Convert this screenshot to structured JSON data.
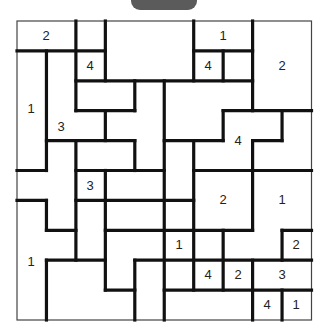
{
  "top_button": {
    "label": "",
    "color": "#5b5b5b"
  },
  "board": {
    "rows": 10,
    "cols": 10,
    "origin": [
      17,
      21
    ],
    "cell_w": 29.45,
    "cell_h": 29.9,
    "thin_border_color": "#444444",
    "wall_color": "#111111",
    "vertical_walls": [
      [
        1,
        1,
        5
      ],
      [
        1,
        6,
        7
      ],
      [
        1,
        8,
        10
      ],
      [
        2,
        0,
        3
      ],
      [
        2,
        4,
        8
      ],
      [
        3,
        0,
        2
      ],
      [
        3,
        3,
        4
      ],
      [
        3,
        5,
        9
      ],
      [
        4,
        2,
        3
      ],
      [
        4,
        4,
        5
      ],
      [
        4,
        8,
        10
      ],
      [
        5,
        2,
        10
      ],
      [
        6,
        0,
        2
      ],
      [
        6,
        4,
        9
      ],
      [
        7,
        1,
        2
      ],
      [
        7,
        3,
        4
      ],
      [
        7,
        7,
        9
      ],
      [
        8,
        0,
        3
      ],
      [
        8,
        4,
        7
      ],
      [
        8,
        8,
        10
      ],
      [
        9,
        3,
        4
      ],
      [
        9,
        7,
        8
      ],
      [
        9,
        9,
        10
      ]
    ],
    "horizontal_walls": [
      [
        1,
        0,
        3
      ],
      [
        1,
        6,
        8
      ],
      [
        2,
        2,
        8
      ],
      [
        3,
        2,
        4
      ],
      [
        3,
        7,
        10
      ],
      [
        4,
        1,
        4
      ],
      [
        4,
        5,
        7
      ],
      [
        4,
        8,
        9
      ],
      [
        5,
        0,
        1
      ],
      [
        5,
        2,
        5
      ],
      [
        5,
        6,
        10
      ],
      [
        6,
        0,
        1
      ],
      [
        6,
        2,
        6
      ],
      [
        7,
        1,
        2
      ],
      [
        7,
        3,
        8
      ],
      [
        7,
        9,
        10
      ],
      [
        8,
        1,
        3
      ],
      [
        8,
        4,
        10
      ],
      [
        9,
        3,
        4
      ],
      [
        9,
        5,
        10
      ]
    ],
    "clues": [
      {
        "value": "2",
        "x": 46,
        "y": 36
      },
      {
        "value": "1",
        "x": 223,
        "y": 36
      },
      {
        "value": "4",
        "x": 90,
        "y": 66
      },
      {
        "value": "4",
        "x": 208,
        "y": 66
      },
      {
        "value": "2",
        "x": 282,
        "y": 66
      },
      {
        "value": "1",
        "x": 31,
        "y": 109
      },
      {
        "value": "3",
        "x": 61,
        "y": 127
      },
      {
        "value": "4",
        "x": 238,
        "y": 141
      },
      {
        "value": "3",
        "x": 90,
        "y": 186
      },
      {
        "value": "2",
        "x": 223,
        "y": 200
      },
      {
        "value": "1",
        "x": 282,
        "y": 200
      },
      {
        "value": "1",
        "x": 179,
        "y": 245
      },
      {
        "value": "2",
        "x": 296,
        "y": 245
      },
      {
        "value": "1",
        "x": 31,
        "y": 262
      },
      {
        "value": "4",
        "x": 208,
        "y": 275
      },
      {
        "value": "2",
        "x": 238,
        "y": 275
      },
      {
        "value": "3",
        "x": 282,
        "y": 275
      },
      {
        "value": "4",
        "x": 267,
        "y": 305
      },
      {
        "value": "1",
        "x": 296,
        "y": 305
      }
    ]
  }
}
